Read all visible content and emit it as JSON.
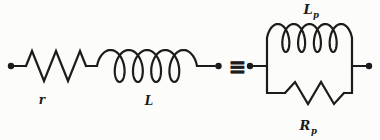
{
  "figure": {
    "type": "circuit-equivalence-diagram",
    "background_color": "#fcfcfa",
    "line_color": "#1c1c1c",
    "series_circuit": {
      "resistor_label": "r",
      "inductor_label": "L"
    },
    "equivalence_symbol": "≡",
    "parallel_circuit": {
      "inductor_symbol": "L",
      "inductor_subscript": "p",
      "resistor_symbol": "R",
      "resistor_subscript": "p"
    }
  }
}
